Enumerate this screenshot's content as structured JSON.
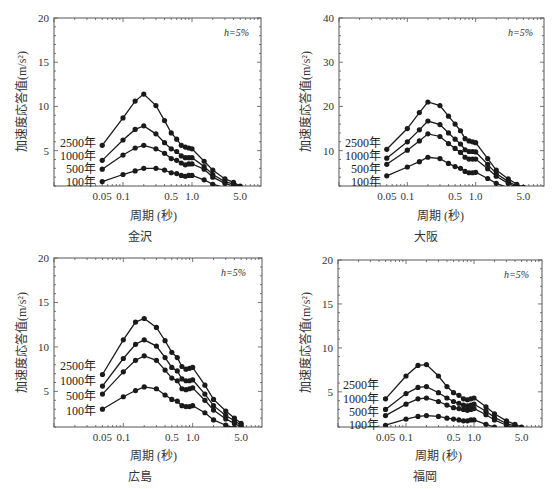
{
  "figure": {
    "periods": [
      0.05,
      0.1,
      0.15,
      0.2,
      0.3,
      0.4,
      0.5,
      0.6,
      0.7,
      0.8,
      0.9,
      1.0,
      1.5,
      2.0,
      3.0,
      4.0,
      5.0
    ],
    "xlabel": "周期 (秒)",
    "ylabel": "加速度応答值(m/s²)",
    "damping_label": "h=5%",
    "legend_labels": [
      "2500年",
      "1000年",
      "500年",
      "100年"
    ],
    "x_tick_labels": [
      "0.05",
      "0.1",
      "0.5",
      "1.0",
      "5.0"
    ],
    "line_color": "#1a1a1a"
  },
  "chart_data": [
    {
      "type": "line",
      "title": "金沢",
      "xlabel": "周期 (秒)",
      "ylabel": "加速度応答值(m/s²)",
      "xscale": "log",
      "xlim": [
        0.01,
        10
      ],
      "ylim": [
        1,
        20
      ],
      "yticks": [
        5,
        10,
        15,
        20
      ],
      "xticks": [
        0.05,
        0.1,
        0.5,
        1.0,
        5.0
      ],
      "annotation": "h=5%",
      "x": [
        0.05,
        0.1,
        0.15,
        0.2,
        0.3,
        0.4,
        0.5,
        0.6,
        0.7,
        0.8,
        0.9,
        1.0,
        1.5,
        2.0,
        3.0,
        4.0,
        5.0
      ],
      "series": [
        {
          "name": "2500年",
          "values": [
            5.6,
            8.7,
            10.6,
            11.4,
            10.1,
            8.4,
            7.0,
            6.3,
            5.6,
            5.4,
            5.3,
            5.2,
            3.8,
            2.8,
            1.8,
            1.4,
            1.0
          ]
        },
        {
          "name": "1000年",
          "values": [
            3.9,
            6.2,
            7.4,
            7.8,
            6.9,
            5.9,
            5.2,
            4.9,
            4.4,
            4.2,
            4.2,
            4.2,
            3.2,
            2.3,
            1.5,
            1.2,
            0.9
          ]
        },
        {
          "name": "500年",
          "values": [
            2.9,
            4.5,
            5.3,
            5.6,
            5.2,
            4.7,
            4.1,
            3.9,
            3.6,
            3.4,
            3.5,
            3.5,
            2.9,
            2.0,
            1.3,
            1.0,
            0.8
          ]
        },
        {
          "name": "100年",
          "values": [
            1.5,
            2.3,
            2.7,
            3.0,
            3.0,
            2.8,
            2.5,
            2.4,
            2.2,
            2.1,
            2.2,
            2.2,
            1.7,
            1.2,
            0.8,
            0.6,
            0.5
          ]
        }
      ]
    },
    {
      "type": "line",
      "title": "大阪",
      "xlabel": "周期 (秒)",
      "ylabel": "加速度応答值(m/s²)",
      "xscale": "log",
      "xlim": [
        0.01,
        10
      ],
      "ylim": [
        2,
        40
      ],
      "yticks": [
        10,
        20,
        30,
        40
      ],
      "xticks": [
        0.05,
        0.1,
        0.5,
        1.0,
        5.0
      ],
      "annotation": "h=5%",
      "x": [
        0.05,
        0.1,
        0.15,
        0.2,
        0.3,
        0.4,
        0.5,
        0.6,
        0.7,
        0.8,
        0.9,
        1.0,
        1.5,
        2.0,
        3.0,
        4.0,
        5.0
      ],
      "series": [
        {
          "name": "2500年",
          "values": [
            10.3,
            15.0,
            18.6,
            21.0,
            20.2,
            17.8,
            16.0,
            14.5,
            12.7,
            12.2,
            12.0,
            11.8,
            8.2,
            5.6,
            3.6,
            2.4,
            1.7
          ]
        },
        {
          "name": "1000年",
          "values": [
            8.3,
            12.0,
            14.7,
            16.7,
            15.9,
            14.0,
            12.6,
            11.5,
            10.2,
            9.8,
            9.8,
            9.7,
            6.9,
            4.8,
            3.0,
            2.0,
            1.4
          ]
        },
        {
          "name": "500年",
          "values": [
            6.9,
            10.1,
            12.2,
            13.8,
            13.2,
            11.6,
            10.5,
            9.6,
            8.5,
            8.1,
            8.1,
            8.1,
            5.9,
            4.2,
            2.6,
            1.7,
            1.2
          ]
        },
        {
          "name": "100年",
          "values": [
            4.3,
            6.3,
            7.5,
            8.5,
            8.2,
            7.1,
            6.4,
            6.0,
            5.3,
            5.0,
            5.0,
            5.1,
            3.7,
            2.6,
            1.6,
            1.1,
            0.8
          ]
        }
      ]
    },
    {
      "type": "line",
      "title": "広島",
      "xlabel": "周期 (秒)",
      "ylabel": "加速度応答值(m/s²)",
      "xscale": "log",
      "xlim": [
        0.01,
        10
      ],
      "ylim": [
        1,
        20
      ],
      "yticks": [
        5,
        10,
        15,
        20
      ],
      "xticks": [
        0.05,
        0.1,
        0.5,
        1.0,
        5.0
      ],
      "annotation": "h=5%",
      "x": [
        0.05,
        0.1,
        0.15,
        0.2,
        0.3,
        0.4,
        0.5,
        0.6,
        0.7,
        0.8,
        0.9,
        1.0,
        1.5,
        2.0,
        3.0,
        4.0,
        5.0
      ],
      "series": [
        {
          "name": "2500年",
          "values": [
            6.9,
            10.8,
            12.8,
            13.2,
            12.2,
            10.7,
            9.4,
            8.8,
            7.8,
            7.5,
            7.6,
            7.7,
            5.7,
            4.1,
            2.8,
            2.0,
            1.4
          ]
        },
        {
          "name": "1000年",
          "values": [
            5.6,
            8.7,
            10.3,
            10.8,
            10.1,
            8.8,
            7.7,
            7.3,
            6.4,
            6.2,
            6.2,
            6.3,
            4.7,
            3.4,
            2.3,
            1.7,
            1.2
          ]
        },
        {
          "name": "500年",
          "values": [
            4.7,
            7.2,
            8.5,
            9.0,
            8.5,
            7.4,
            6.5,
            6.2,
            5.3,
            5.2,
            5.3,
            5.4,
            4.0,
            2.9,
            1.9,
            1.4,
            1.0
          ]
        },
        {
          "name": "100年",
          "values": [
            3.0,
            4.4,
            5.1,
            5.5,
            5.3,
            4.6,
            4.1,
            3.9,
            3.4,
            3.3,
            3.3,
            3.4,
            2.6,
            1.8,
            1.2,
            0.9,
            0.7
          ]
        }
      ]
    },
    {
      "type": "line",
      "title": "福岡",
      "xlabel": "周期 (秒)",
      "ylabel": "加速度応答值(m/s²)",
      "xscale": "log",
      "xlim": [
        0.01,
        10
      ],
      "ylim": [
        1,
        20
      ],
      "yticks": [
        5,
        10,
        15,
        20
      ],
      "xticks": [
        0.05,
        0.1,
        0.5,
        1.0,
        5.0
      ],
      "annotation": "h=5%",
      "x": [
        0.05,
        0.1,
        0.15,
        0.2,
        0.3,
        0.4,
        0.5,
        0.6,
        0.7,
        0.8,
        0.9,
        1.0,
        1.5,
        2.0,
        3.0,
        4.0,
        5.0
      ],
      "series": [
        {
          "name": "2500年",
          "values": [
            4.2,
            6.8,
            8.0,
            8.1,
            6.8,
            5.6,
            4.9,
            4.6,
            4.2,
            4.1,
            4.2,
            4.3,
            3.3,
            2.5,
            1.7,
            1.3,
            1.0
          ]
        },
        {
          "name": "1000年",
          "values": [
            3.0,
            4.8,
            5.5,
            5.6,
            4.9,
            4.3,
            3.9,
            3.7,
            3.5,
            3.4,
            3.5,
            3.6,
            2.8,
            2.1,
            1.4,
            1.1,
            0.8
          ]
        },
        {
          "name": "500年",
          "values": [
            2.3,
            3.6,
            4.2,
            4.3,
            3.9,
            3.5,
            3.2,
            3.1,
            3.0,
            2.9,
            3.0,
            3.1,
            2.4,
            1.8,
            1.2,
            0.9,
            0.7
          ]
        },
        {
          "name": "100年",
          "values": [
            1.2,
            1.9,
            2.2,
            2.3,
            2.2,
            2.0,
            1.9,
            1.8,
            1.7,
            1.7,
            1.8,
            1.8,
            1.3,
            1.0,
            0.7,
            0.5,
            0.4
          ]
        }
      ]
    }
  ]
}
